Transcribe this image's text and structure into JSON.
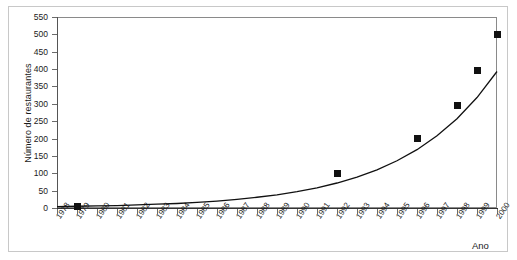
{
  "chart_data": {
    "type": "scatter",
    "title": "",
    "xlabel": "Ano",
    "ylabel": "Número de restaurantes",
    "xlim": [
      1978,
      2000
    ],
    "ylim": [
      0,
      550
    ],
    "grid": false,
    "legend": "none",
    "x_tick_labels": [
      "1978",
      "1979",
      "1980",
      "1981",
      "1982",
      "1983",
      "1984",
      "1985",
      "1986",
      "1987",
      "1988",
      "1989",
      "1990",
      "1991",
      "1992",
      "1993",
      "1994",
      "1995",
      "1996",
      "1997",
      "1998",
      "1999",
      "2000"
    ],
    "y_tick_labels": [
      "0",
      "50",
      "100",
      "150",
      "200",
      "250",
      "300",
      "350",
      "400",
      "450",
      "500",
      "550"
    ],
    "y_tick_values": [
      0,
      50,
      100,
      150,
      200,
      250,
      300,
      350,
      400,
      450,
      500,
      550
    ],
    "series": [
      {
        "name": "Número de restaurantes",
        "type": "scatter",
        "marker": "square",
        "color": "#111111",
        "x": [
          1979,
          1992,
          1996,
          1998,
          1999,
          2000
        ],
        "values": [
          5,
          100,
          200,
          295,
          395,
          500
        ]
      },
      {
        "name": "Curva de ajuste exponencial",
        "type": "line",
        "color": "#111111",
        "x": [
          1978,
          1979,
          1980,
          1981,
          1982,
          1983,
          1984,
          1985,
          1986,
          1987,
          1988,
          1989,
          1990,
          1991,
          1992,
          1993,
          1994,
          1995,
          1996,
          1997,
          1998,
          1999,
          2000
        ],
        "values": [
          4,
          5,
          6,
          7,
          9,
          11,
          13,
          16,
          20,
          25,
          31,
          38,
          47,
          58,
          72,
          89,
          110,
          136,
          168,
          208,
          257,
          318,
          393
        ]
      }
    ]
  },
  "axis": {
    "y_title": "Número de restaurantes",
    "x_title": "Ano"
  }
}
